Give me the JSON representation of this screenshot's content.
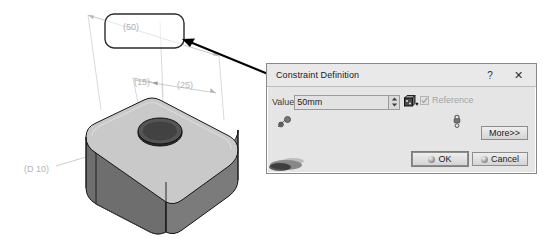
{
  "app": {
    "name": "CAD Constraint Editor"
  },
  "cad": {
    "viewport_name": "3d-model-viewport",
    "part_name": "rounded-rectangular-block",
    "dimensions": [
      {
        "name": "length-dimension",
        "label": "(50)",
        "driven": true
      },
      {
        "name": "offset-dimension",
        "label": "(15)",
        "driven": true
      },
      {
        "name": "width-dimension",
        "label": "(25)",
        "driven": true
      },
      {
        "name": "diameter-dimension",
        "label": "(D 10)",
        "driven": true
      }
    ],
    "highlight_box": {
      "name": "selected-dimension-highlight",
      "target_label": "(50)"
    },
    "annotation_arrow": {
      "name": "callout-arrow",
      "from": "dialog",
      "to": "selected-dimension-highlight"
    },
    "colors": {
      "dimension_text": "#b3b3b3",
      "dimension_line": "#c2c2c2",
      "model_top_face": "#c9c9c9",
      "model_front_face": "#6b6b6b",
      "model_side_face": "#8e8e8e",
      "model_edge": "#1a1a1a",
      "arrow": "#000000",
      "highlight_border": "#2b2b2b"
    }
  },
  "dialog": {
    "title": "Constraint Definition",
    "help_label": "?",
    "close_label": "✕",
    "value": {
      "label": "Value",
      "text": "50mm",
      "placeholder": "50mm",
      "spinner_up": "▲",
      "spinner_down": "▼",
      "formula_icon": "formula-icon"
    },
    "reference": {
      "label": "Reference",
      "checked": true,
      "disabled": true
    },
    "buttons": {
      "more": "More>>",
      "ok": "OK",
      "cancel": "Cancel"
    },
    "colors": {
      "background": "#e5e5e5",
      "titlebar": "#e9e9e9",
      "border": "#8a8a8a",
      "input_background": "#e2e2e2",
      "text": "#1a1a1a",
      "disabled_text": "#9a9a9a"
    }
  }
}
